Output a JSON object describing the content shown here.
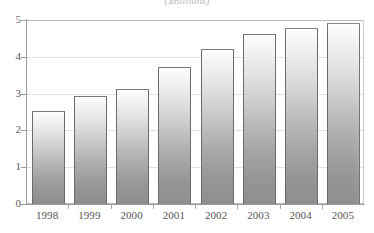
{
  "chart_data": {
    "type": "bar",
    "title": "($Billions)",
    "xlabel": "",
    "ylabel": "",
    "categories": [
      "1998",
      "1999",
      "2000",
      "2001",
      "2002",
      "2003",
      "2004",
      "2005"
    ],
    "values": [
      2.55,
      2.95,
      3.15,
      3.75,
      4.25,
      4.65,
      4.8,
      4.95
    ],
    "ylim": [
      0,
      5
    ],
    "ytick_labels": [
      "0",
      "1",
      "2",
      "3",
      "4",
      "5"
    ],
    "ytick_values": [
      0,
      1,
      2,
      3,
      4,
      5
    ],
    "grid": true,
    "legend": "none",
    "series": [
      {
        "name": "",
        "values": [
          2.55,
          2.95,
          3.15,
          3.75,
          4.25,
          4.65,
          4.8,
          4.95
        ]
      }
    ],
    "colors": {
      "bar_top": "#fdfdfd",
      "bar_bottom": "#8e8e8e",
      "bar_border": "#6b6b6b",
      "gridline": "#e2e2e2",
      "axis": "#9c9c9c",
      "text": "#545454",
      "background": "#ffffff"
    }
  }
}
